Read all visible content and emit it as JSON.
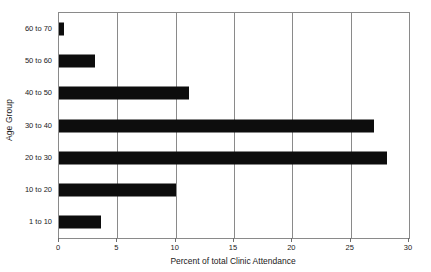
{
  "chart_data": {
    "type": "bar",
    "orientation": "horizontal",
    "title": "",
    "xlabel": "Percent of total Clinic Attendance",
    "ylabel": "Age Group",
    "categories": [
      "1 to 10",
      "10 to 20",
      "20 to 30",
      "30 to 40",
      "40 to 50",
      "50 to 60",
      "60 to 70"
    ],
    "values": [
      3.6,
      10.0,
      28.1,
      27.0,
      11.1,
      3.1,
      0.4
    ],
    "xlim": [
      0,
      30
    ],
    "xticks": [
      0,
      5,
      10,
      15,
      20,
      25,
      30
    ],
    "xtick_labels": [
      "0",
      "5",
      "10",
      "15",
      "20",
      "25",
      "30"
    ],
    "grid": "vertical-only",
    "legend": null,
    "bar_color": "#0d0d0d",
    "axis_color": "#8a8a8a",
    "background": "#ffffff"
  },
  "axes": {
    "x_title": "Percent of total Clinic Attendance",
    "y_title": "Age Group"
  }
}
